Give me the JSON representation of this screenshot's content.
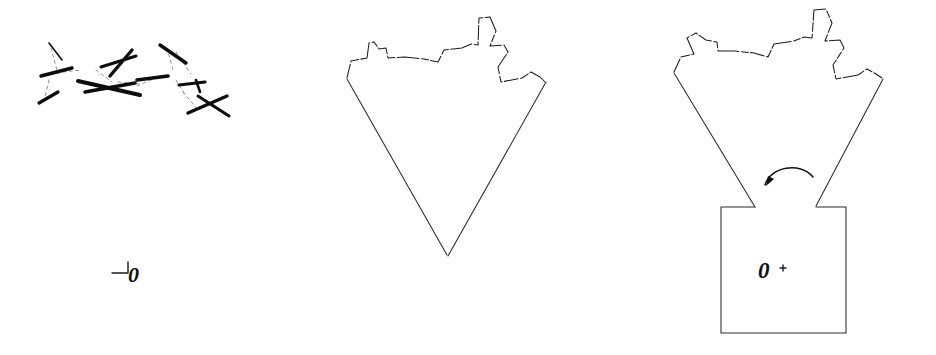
{
  "figure": {
    "background_color": "#ffffff",
    "ink_color": "#111111",
    "width": 936,
    "height": 355,
    "style": "scanned line drawing, three panels, no frames"
  },
  "panels": [
    {
      "id": "panel-a",
      "name": "scattered-segments-panel",
      "description": "cloud of bold short line segments joined by faint dashed connectors",
      "origin_label": "0",
      "origin_marker": "corner-tick",
      "segment_count": 12
    },
    {
      "id": "panel-b",
      "name": "wedge-panel",
      "description": "downward V wedge with jagged crenellated top edge, apex at origin",
      "origin_label": "0",
      "origin_marker": "apex",
      "jag_count": 14
    },
    {
      "id": "panel-c",
      "name": "rotated-wedge-panel",
      "description": "wedge rotated about origin with rectangular base block and rotation arrow",
      "origin_label": "O",
      "origin_marker": "cross-dot",
      "angle_label": "θ",
      "rotation_direction": "counter-clockwise",
      "jag_count": 14
    }
  ],
  "labels": {
    "panel_a_origin": "0",
    "panel_b_origin": "0",
    "panel_c_origin": "O",
    "panel_c_theta": "θ"
  },
  "colors": {
    "ink": "#111111",
    "ink_soft": "#2b2b2b",
    "ink_faint": "#5d5d5d",
    "paper": "#ffffff"
  }
}
